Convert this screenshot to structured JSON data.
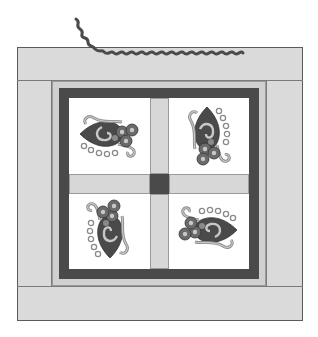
{
  "figure": {
    "colors": {
      "outer_border": "#dadada",
      "inner_light_frame": "#d0d0d0",
      "dark_frame": "#4a4a4a",
      "sashing": "#d7d7d7",
      "block_background": "#ffffff",
      "motif_dark": "#4a4a4a",
      "motif_mid": "#8a8a8a",
      "motif_light": "#c8c8c8"
    },
    "blocks": [
      {
        "position": "top-left",
        "motif": "heart-flower-motif",
        "orientation": "left"
      },
      {
        "position": "top-right",
        "motif": "heart-flower-motif",
        "orientation": "up"
      },
      {
        "position": "bottom-left",
        "motif": "heart-flower-motif",
        "orientation": "down"
      },
      {
        "position": "bottom-right",
        "motif": "heart-flower-motif",
        "orientation": "right"
      }
    ],
    "trim": "rickrack"
  }
}
